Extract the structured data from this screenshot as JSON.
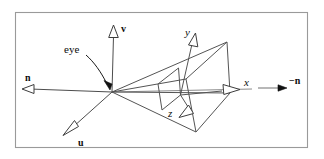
{
  "figure": {
    "background_color": "#ffffff",
    "frame_color": "#9a9a9a",
    "line_color": "#545454",
    "text_color": "#0d0d0d"
  },
  "labels": {
    "v_axis": "v",
    "u_axis": "u",
    "n_axis": "n",
    "neg_n_axis": "−n",
    "x_axis": "x",
    "y_axis": "y",
    "z_axis": "z",
    "eye": "eye"
  },
  "geometry": {
    "eye_point": [
      112,
      92
    ],
    "frame": [
      15,
      12,
      293,
      136
    ],
    "far_plane_corners": [
      [
        227,
        42
      ],
      [
        230,
        93
      ],
      [
        196,
        132
      ],
      [
        186,
        79
      ]
    ],
    "near_plane_corners": [
      [
        178,
        68
      ],
      [
        180,
        95
      ],
      [
        161,
        110
      ],
      [
        157,
        84
      ]
    ],
    "v_axis_tip": [
      114,
      26
    ],
    "u_axis_tip": [
      65,
      132
    ],
    "n_axis_tip": [
      23,
      89
    ],
    "neg_n_arrow": [
      [
        258,
        88
      ],
      [
        286,
        88
      ]
    ],
    "x_axis_tip": [
      240,
      89
    ],
    "y_axis_tip": [
      196,
      33
    ],
    "z_axis_tip": [
      186,
      116
    ]
  }
}
